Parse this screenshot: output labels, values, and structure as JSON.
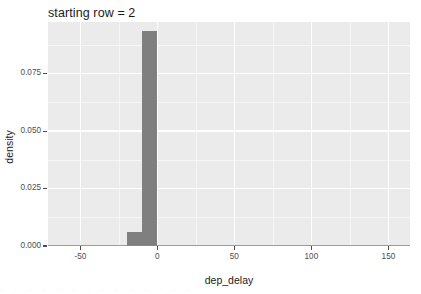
{
  "chart_data": {
    "type": "bar",
    "title": "starting row = 2",
    "xlabel": "dep_delay",
    "ylabel": "density",
    "xlim": [
      -71,
      164
    ],
    "ylim": [
      0,
      0.0975
    ],
    "xticks": [
      -50,
      0,
      50,
      100,
      150
    ],
    "xtick_labels": [
      "-50",
      "0",
      "50",
      "100",
      "150"
    ],
    "yticks": [
      0.0,
      0.025,
      0.05,
      0.075
    ],
    "ytick_labels": [
      "0.000",
      "0.025",
      "0.050",
      "0.075"
    ],
    "x_minor_ticks": [
      -25,
      25,
      75,
      125
    ],
    "y_minor_ticks": [
      0.0125,
      0.0375,
      0.0625,
      0.0875
    ],
    "grid": true,
    "legend": "none",
    "binwidth": 10,
    "bars": [
      {
        "bin_start": -20,
        "bin_end": -10,
        "value": 0.0062
      },
      {
        "bin_start": -10,
        "bin_end": 0,
        "value": 0.0935
      }
    ],
    "colors": {
      "bar_fill": "#7f7f7f",
      "panel_background": "#ebebeb",
      "grid_line": "#ffffff",
      "baseline": "#8c8c8c",
      "text": "#1a1a1a",
      "tick_text": "#4d4d4d",
      "page_background": "#ffffff"
    }
  },
  "bottom_artifact": {
    "text": ". . . . . . . . . . . . . ."
  }
}
